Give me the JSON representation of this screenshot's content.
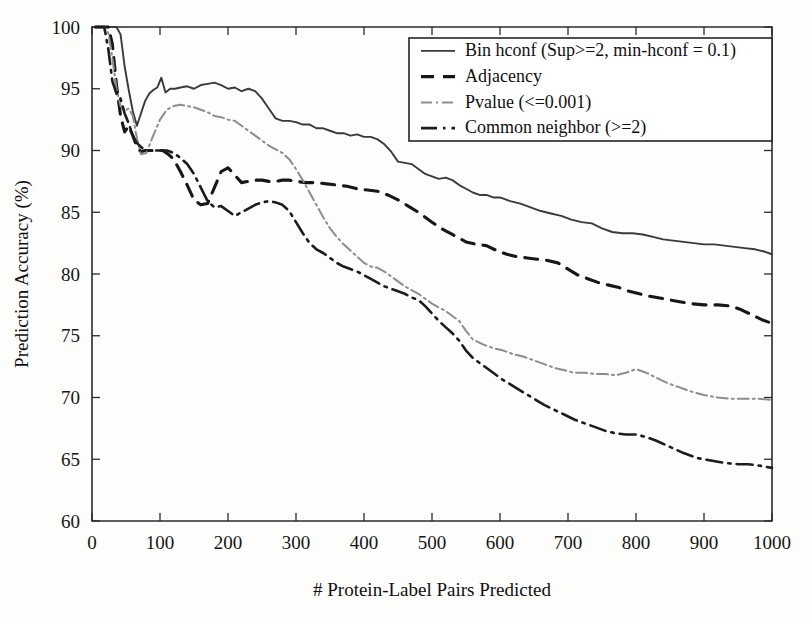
{
  "figure": {
    "background": "#fdfdfc",
    "ink": "#1a1a1a"
  },
  "chart_data": {
    "type": "line",
    "title": "",
    "xlabel": "# Protein-Label Pairs Predicted",
    "ylabel": "Prediction Accuracy (%)",
    "xlim": [
      0,
      1000
    ],
    "ylim": [
      60,
      100
    ],
    "xticks": [
      0,
      100,
      200,
      300,
      400,
      500,
      600,
      700,
      800,
      900,
      1000
    ],
    "yticks": [
      60,
      65,
      70,
      75,
      80,
      85,
      90,
      95,
      100
    ],
    "xtick_labels": [
      "0",
      "100",
      "200",
      "300",
      "400",
      "500",
      "600",
      "700",
      "800",
      "900",
      "1000"
    ],
    "ytick_labels": [
      "60",
      "65",
      "70",
      "75",
      "80",
      "85",
      "90",
      "95",
      "100"
    ],
    "grid": false,
    "legend_position": "top-right",
    "series": [
      {
        "name": "Bin hconf (Sup>=2, min-hconf  = 0.1)",
        "style": "solid",
        "color": "#3a3a3a",
        "width": 1.9,
        "dash": "",
        "x": [
          5,
          12,
          18,
          24,
          30,
          36,
          42,
          48,
          54,
          60,
          66,
          72,
          78,
          84,
          90,
          96,
          102,
          108,
          115,
          122,
          130,
          140,
          150,
          160,
          170,
          180,
          190,
          200,
          210,
          220,
          230,
          240,
          250,
          260,
          270,
          280,
          290,
          300,
          310,
          320,
          330,
          340,
          350,
          360,
          370,
          380,
          390,
          400,
          410,
          420,
          430,
          440,
          450,
          460,
          470,
          480,
          490,
          500,
          510,
          520,
          530,
          540,
          550,
          560,
          570,
          580,
          590,
          600,
          615,
          630,
          645,
          660,
          675,
          690,
          705,
          720,
          735,
          750,
          765,
          780,
          795,
          810,
          825,
          840,
          855,
          870,
          885,
          900,
          915,
          930,
          945,
          960,
          975,
          990,
          1000
        ],
        "y": [
          100,
          100,
          100,
          100,
          100,
          100,
          99.4,
          96.8,
          94.9,
          93.2,
          92.0,
          93.0,
          94.0,
          94.6,
          94.9,
          95.1,
          95.9,
          94.7,
          95.0,
          95.0,
          95.1,
          95.2,
          95.0,
          95.3,
          95.4,
          95.5,
          95.3,
          95.0,
          95.1,
          94.8,
          95.0,
          94.8,
          94.2,
          93.4,
          92.6,
          92.4,
          92.4,
          92.3,
          92.1,
          92.1,
          91.8,
          91.8,
          91.6,
          91.4,
          91.4,
          91.2,
          91.3,
          91.1,
          91.1,
          90.9,
          90.5,
          89.9,
          89.1,
          89.0,
          88.9,
          88.5,
          88.1,
          87.9,
          87.7,
          87.8,
          87.6,
          87.2,
          86.9,
          86.6,
          86.4,
          86.4,
          86.2,
          86.2,
          85.9,
          85.7,
          85.4,
          85.1,
          84.9,
          84.7,
          84.4,
          84.2,
          84.1,
          83.7,
          83.4,
          83.3,
          83.3,
          83.2,
          83.0,
          82.8,
          82.7,
          82.6,
          82.5,
          82.4,
          82.4,
          82.3,
          82.2,
          82.1,
          82.0,
          81.8,
          81.6
        ]
      },
      {
        "name": "Adjacency",
        "style": "dashed",
        "color": "#171717",
        "width": 3.1,
        "dash": "13,9",
        "x": [
          5,
          12,
          18,
          24,
          30,
          36,
          42,
          48,
          54,
          60,
          66,
          72,
          78,
          84,
          90,
          96,
          104,
          112,
          120,
          130,
          140,
          150,
          160,
          170,
          180,
          190,
          200,
          210,
          220,
          230,
          240,
          250,
          260,
          270,
          280,
          290,
          300,
          315,
          330,
          345,
          360,
          375,
          390,
          405,
          420,
          435,
          450,
          465,
          480,
          490,
          500,
          510,
          520,
          530,
          540,
          550,
          565,
          580,
          595,
          610,
          625,
          640,
          655,
          670,
          685,
          700,
          715,
          730,
          745,
          760,
          775,
          790,
          805,
          820,
          840,
          860,
          880,
          900,
          920,
          940,
          955,
          970,
          985,
          1000
        ],
        "y": [
          100,
          100,
          100,
          100,
          98.6,
          95.3,
          92.8,
          91.5,
          92.0,
          91.2,
          90.3,
          89.9,
          90.0,
          90.0,
          90.0,
          90.0,
          90.0,
          89.7,
          89.3,
          88.3,
          87.2,
          86.0,
          85.6,
          85.7,
          87.0,
          88.3,
          88.6,
          88.0,
          87.4,
          87.5,
          87.6,
          87.6,
          87.5,
          87.5,
          87.6,
          87.6,
          87.5,
          87.4,
          87.4,
          87.3,
          87.2,
          87.1,
          86.9,
          86.8,
          86.7,
          86.4,
          86.0,
          85.5,
          85.0,
          84.6,
          84.2,
          83.8,
          83.5,
          83.2,
          82.9,
          82.6,
          82.4,
          82.3,
          81.9,
          81.6,
          81.4,
          81.3,
          81.2,
          81.1,
          80.9,
          80.4,
          79.9,
          79.6,
          79.3,
          79.1,
          78.9,
          78.6,
          78.4,
          78.2,
          78.0,
          77.8,
          77.6,
          77.5,
          77.5,
          77.4,
          77.1,
          76.7,
          76.3,
          76.0
        ]
      },
      {
        "name": "Pvalue (<=0.001)",
        "style": "dash-dot-light",
        "color": "#8d8d8d",
        "width": 2.0,
        "dash": "11,4,2,4",
        "x": [
          5,
          12,
          18,
          24,
          30,
          36,
          42,
          48,
          54,
          60,
          66,
          72,
          80,
          90,
          100,
          110,
          120,
          130,
          140,
          150,
          160,
          170,
          180,
          190,
          200,
          210,
          220,
          230,
          240,
          250,
          260,
          270,
          280,
          290,
          300,
          310,
          320,
          330,
          340,
          350,
          360,
          370,
          380,
          390,
          400,
          410,
          420,
          430,
          440,
          450,
          460,
          470,
          480,
          490,
          500,
          510,
          520,
          530,
          540,
          550,
          560,
          575,
          590,
          605,
          620,
          635,
          650,
          665,
          680,
          695,
          710,
          725,
          740,
          755,
          770,
          785,
          800,
          815,
          830,
          845,
          860,
          880,
          900,
          920,
          940,
          960,
          980,
          1000
        ],
        "y": [
          100,
          100,
          100,
          99.5,
          97.5,
          95.0,
          93.6,
          93.2,
          93.4,
          92.8,
          91.0,
          89.7,
          89.8,
          91.2,
          92.5,
          93.3,
          93.6,
          93.7,
          93.6,
          93.5,
          93.3,
          93.1,
          92.8,
          92.7,
          92.5,
          92.4,
          92.0,
          91.6,
          91.2,
          90.8,
          90.4,
          90.1,
          89.8,
          89.3,
          88.5,
          87.6,
          86.6,
          85.6,
          84.6,
          83.7,
          83.0,
          82.4,
          81.9,
          81.4,
          80.9,
          80.6,
          80.5,
          80.2,
          79.8,
          79.4,
          79.0,
          78.7,
          78.4,
          78.0,
          77.6,
          77.3,
          77.0,
          76.6,
          76.2,
          75.4,
          74.7,
          74.3,
          74.0,
          73.8,
          73.5,
          73.3,
          73.0,
          72.7,
          72.4,
          72.2,
          72.0,
          72.0,
          71.9,
          71.9,
          71.8,
          72.0,
          72.3,
          72.0,
          71.6,
          71.2,
          70.9,
          70.5,
          70.2,
          70.0,
          69.9,
          69.9,
          69.9,
          69.8
        ]
      },
      {
        "name": "Common neighbor (>=2)",
        "style": "dash-dot-dark",
        "color": "#1c1c1c",
        "width": 2.6,
        "dash": "16,6,2.5,6",
        "x": [
          5,
          12,
          18,
          24,
          30,
          36,
          42,
          48,
          54,
          60,
          66,
          74,
          82,
          90,
          100,
          110,
          120,
          130,
          140,
          150,
          160,
          170,
          180,
          190,
          200,
          210,
          220,
          230,
          240,
          250,
          260,
          270,
          280,
          290,
          300,
          310,
          320,
          330,
          340,
          350,
          360,
          370,
          380,
          390,
          400,
          410,
          420,
          430,
          440,
          450,
          460,
          470,
          480,
          490,
          500,
          510,
          520,
          530,
          540,
          550,
          560,
          575,
          590,
          605,
          620,
          635,
          650,
          665,
          680,
          695,
          710,
          725,
          740,
          755,
          770,
          785,
          800,
          815,
          830,
          850,
          870,
          890,
          910,
          930,
          950,
          965,
          980,
          1000
        ],
        "y": [
          100,
          100,
          100,
          98.2,
          95.6,
          94.6,
          94.2,
          93.0,
          92.2,
          91.2,
          90.6,
          90.2,
          90.0,
          90.0,
          90.0,
          90.0,
          89.8,
          89.4,
          88.9,
          88.1,
          87.0,
          85.9,
          85.4,
          85.5,
          85.1,
          84.7,
          85.0,
          85.3,
          85.6,
          85.8,
          85.9,
          85.8,
          85.6,
          85.1,
          84.2,
          83.3,
          82.5,
          82.0,
          81.7,
          81.3,
          80.9,
          80.6,
          80.4,
          80.2,
          79.9,
          79.6,
          79.3,
          79.0,
          78.8,
          78.6,
          78.4,
          78.1,
          77.9,
          77.4,
          76.8,
          76.2,
          75.7,
          75.2,
          74.6,
          73.8,
          73.2,
          72.6,
          72.0,
          71.4,
          70.9,
          70.4,
          69.9,
          69.4,
          69.0,
          68.6,
          68.2,
          67.9,
          67.6,
          67.3,
          67.1,
          67.0,
          67.0,
          66.8,
          66.5,
          66.0,
          65.5,
          65.1,
          64.9,
          64.7,
          64.6,
          64.6,
          64.5,
          64.3
        ]
      }
    ]
  }
}
